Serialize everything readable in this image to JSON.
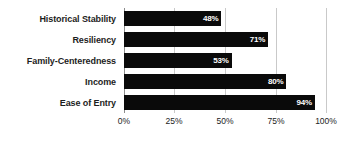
{
  "chart_data": {
    "type": "bar",
    "orientation": "horizontal",
    "title": "",
    "xlabel": "",
    "ylabel": "",
    "categories": [
      "Historical Stability",
      "Resiliency",
      "Family-Centeredness",
      "Income",
      "Ease of Entry"
    ],
    "values": [
      48,
      71,
      53,
      80,
      94
    ],
    "value_labels": [
      "48%",
      "71%",
      "53%",
      "80%",
      "94%"
    ],
    "xlim": [
      0,
      100
    ],
    "xticks": [
      0,
      25,
      50,
      75,
      100
    ],
    "xtick_labels": [
      "0%",
      "25%",
      "50%",
      "75%",
      "100%"
    ],
    "grid": true,
    "grid_axis": "x",
    "legend": false,
    "legend_position": "none",
    "bar_color": "#0a0a0a",
    "value_label_color": "#ffffff",
    "gridline_color": "#c9c9c9",
    "axis_color": "#8c8c8c",
    "category_label_color": "#1d1d1d",
    "background": "#ffffff"
  }
}
